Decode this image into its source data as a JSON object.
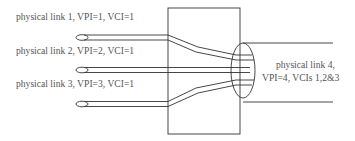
{
  "diagram": {
    "type": "atm-multiplexing",
    "colors": {
      "line": "#333333",
      "text": "#555555",
      "background": "#ffffff"
    },
    "inputs": [
      {
        "id": "link1",
        "label": "physical link 1, VPI=1, VCI=1"
      },
      {
        "id": "link2",
        "label": "physical link 2, VPI=2, VCI=1"
      },
      {
        "id": "link3",
        "label": "physical link 3, VPI=3, VCI=1"
      }
    ],
    "output": {
      "id": "link4",
      "label_line1": "physical link 4,",
      "label_line2": "VPI=4, VCIs 1,2&3"
    },
    "node": "switch"
  }
}
